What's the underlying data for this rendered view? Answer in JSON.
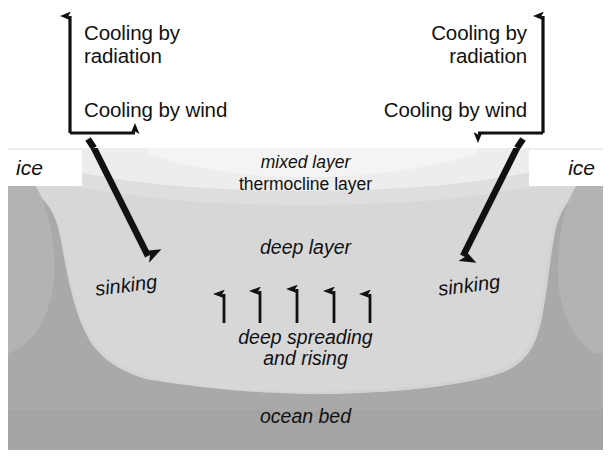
{
  "figure": {
    "type": "oceanographic cross-section diagram",
    "background_color": "#ffffff"
  },
  "atmosphere": {
    "left": {
      "cooling_radiation": "Cooling by\nradiation",
      "cooling_wind": "Cooling by wind",
      "vertical_arrow_direction": "up",
      "horizontal_arrow_direction": "right"
    },
    "right": {
      "cooling_radiation": "Cooling by\nradiation",
      "cooling_wind": "Cooling by wind",
      "vertical_arrow_direction": "up",
      "horizontal_arrow_direction": "left"
    }
  },
  "ice": {
    "left_label": "ice",
    "right_label": "ice"
  },
  "ocean": {
    "layers": [
      {
        "name": "mixed layer",
        "label": "mixed layer",
        "style": "italic",
        "color": "#e8e8e8"
      },
      {
        "name": "thermocline layer",
        "label": "thermocline layer",
        "style": "roman",
        "color": "#d8d8d8"
      },
      {
        "name": "deep layer",
        "label": "deep layer",
        "style": "italic",
        "color": "#d0d0d0"
      },
      {
        "name": "ocean bed",
        "label": "ocean bed",
        "style": "italic",
        "color": "#a8a8a8"
      }
    ],
    "deep_spreading_label": "deep spreading\nand rising",
    "rising_arrow_count": 5,
    "sinking_left_label": "sinking",
    "sinking_right_label": "sinking",
    "sinking_arrow_count": 2
  },
  "colors": {
    "ink": "#111111",
    "mixed_layer": "#e9e9e9",
    "thermocline_layer": "#dcdcdc",
    "deep_layer": "#d2d2d2",
    "ocean_bed": "#a9a9a9",
    "margin_shadow": "#b4b4b4",
    "white": "#ffffff"
  }
}
